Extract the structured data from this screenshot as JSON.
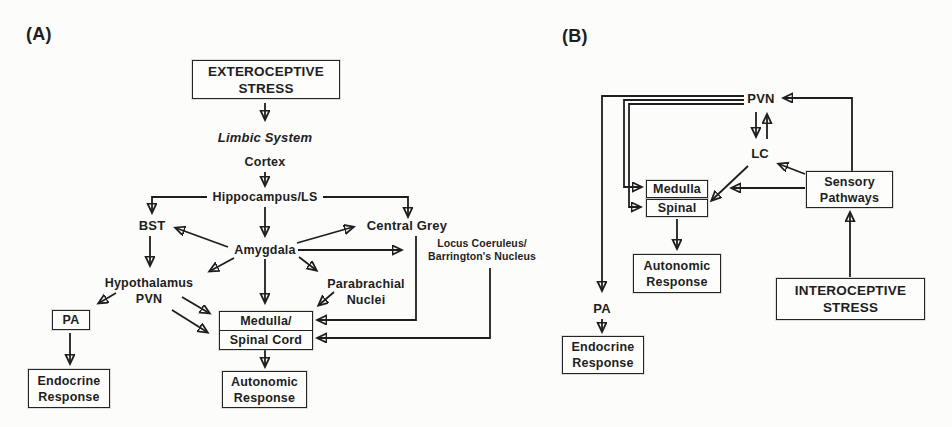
{
  "figure": {
    "panel_a": {
      "label": "(A)",
      "exteroceptive": {
        "line1": "EXTEROCEPTIVE",
        "line2": "STRESS"
      },
      "limbic": "Limbic System",
      "cortex": "Cortex",
      "hippocampus": "Hippocampus/LS",
      "bst": "BST",
      "central_grey": "Central Grey",
      "amygdala": "Amygdala",
      "locus_coeruleus": {
        "line1": "Locus Coeruleus/",
        "line2": "Barrington's Nucleus"
      },
      "hypothalamus": {
        "line1": "Hypothalamus",
        "line2": "PVN"
      },
      "parabrachial": {
        "line1": "Parabrachial",
        "line2": "Nuclei"
      },
      "pa": "PA",
      "medulla_spinal": {
        "line1": "Medulla/",
        "line2": "Spinal Cord"
      },
      "endocrine": {
        "line1": "Endocrine",
        "line2": "Response"
      },
      "autonomic": {
        "line1": "Autonomic",
        "line2": "Response"
      }
    },
    "panel_b": {
      "label": "(B)",
      "pvn": "PVN",
      "lc": "LC",
      "medulla": "Medulla",
      "spinal": "Spinal",
      "sensory": {
        "line1": "Sensory",
        "line2": "Pathways"
      },
      "autonomic": {
        "line1": "Autonomic",
        "line2": "Response"
      },
      "interoceptive": {
        "line1": "INTEROCEPTIVE",
        "line2": "STRESS"
      },
      "pa": "PA",
      "endocrine": {
        "line1": "Endocrine",
        "line2": "Response"
      }
    },
    "colors": {
      "ink": "#1e1e1e",
      "background": "#fcfcfb"
    }
  }
}
